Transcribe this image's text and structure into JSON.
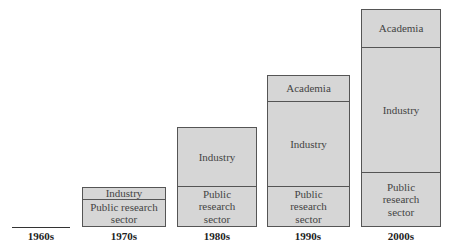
{
  "decades": [
    {
      "label": "1960s",
      "segments": []
    },
    {
      "label": "1970s",
      "segments": [
        {
          "name": "Industry",
          "text": "Industry"
        },
        {
          "name": "Public research sector",
          "text": "Public research sector"
        }
      ]
    },
    {
      "label": "1980s",
      "segments": [
        {
          "name": "Industry",
          "text": "Industry"
        },
        {
          "name": "Public research sector",
          "text": "Public research sector"
        }
      ]
    },
    {
      "label": "1990s",
      "segments": [
        {
          "name": "Academia",
          "text": "Academia"
        },
        {
          "name": "Industry",
          "text": "Industry"
        },
        {
          "name": "Public research sector",
          "text": "Public research sector"
        }
      ]
    },
    {
      "label": "2000s",
      "segments": [
        {
          "name": "Academia",
          "text": "Academia"
        },
        {
          "name": "Industry",
          "text": "Industry"
        },
        {
          "name": "Public research sector",
          "text": "Public research sector"
        }
      ]
    }
  ],
  "colors": {
    "fill": "#d6d6d6",
    "border": "#555555"
  }
}
